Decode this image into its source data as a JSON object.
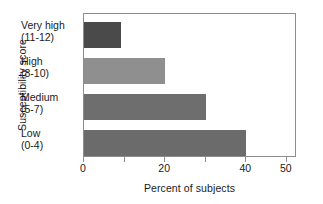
{
  "chart_data": {
    "type": "bar",
    "orientation": "horizontal",
    "title": "",
    "xlabel": "Percent of subjects",
    "ylabel": "Susceptibility score",
    "categories": [
      "Very high (11-12)",
      "High (8-10)",
      "Medium (5-7)",
      "Low (0-4)"
    ],
    "category_lines": [
      {
        "line1": "Very high",
        "line2": "(11-12)"
      },
      {
        "line1": "High",
        "line2": "(8-10)"
      },
      {
        "line1": "Medium",
        "line2": "(5-7)"
      },
      {
        "line1": "Low",
        "line2": "(0-4)"
      }
    ],
    "values": [
      9,
      20,
      30,
      40
    ],
    "bar_colors": [
      "#4a4a4a",
      "#8f8f8f",
      "#6e6e6e",
      "#6b6b6b"
    ],
    "xlim": [
      0,
      52.5
    ],
    "xticks": [
      0,
      10,
      20,
      30,
      40,
      50
    ],
    "xticklabels": [
      "0",
      "",
      "20",
      "",
      "40",
      "50"
    ],
    "grid": false,
    "legend": false,
    "frame_color": "#8d8d8d",
    "background": "#ffffff"
  }
}
